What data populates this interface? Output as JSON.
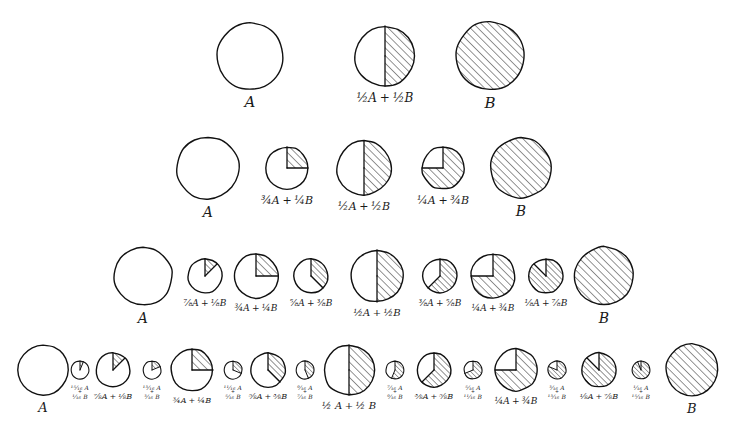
{
  "diagram": {
    "style": {
      "ink": "#111111",
      "paper": "#ffffff",
      "hatch": "#111111",
      "hatch_direction": "lower-left to upper-right",
      "wedge_start": "12 o'clock, clockwise"
    },
    "endpoint_labels": {
      "a": "A",
      "b": "B"
    },
    "rows": [
      {
        "name": "row-halves",
        "denominator": 2,
        "y": 18,
        "items": [
          {
            "label": "A",
            "lines": [
              "A"
            ],
            "b_fraction": 0,
            "r": 33,
            "cx": 250,
            "label_size": 15
          },
          {
            "label": "1/2 A + 1/2 B",
            "lines": [
              "½A + ½B"
            ],
            "b_fraction": 0.5,
            "r": 30,
            "cx": 385,
            "label_size": 12
          },
          {
            "label": "B",
            "lines": [
              "B"
            ],
            "b_fraction": 1,
            "r": 34,
            "cx": 490,
            "label_size": 15
          }
        ]
      },
      {
        "name": "row-quarters",
        "denominator": 4,
        "y": 133,
        "items": [
          {
            "label": "A",
            "lines": [
              "A"
            ],
            "b_fraction": 0,
            "r": 31,
            "cx": 208,
            "label_size": 14
          },
          {
            "label": "3/4 A + 1/4 B",
            "lines": [
              "¾A + ¼B"
            ],
            "b_fraction": 0.25,
            "r": 21,
            "cx": 287,
            "label_size": 11
          },
          {
            "label": "1/2 A + 1/2 B",
            "lines": [
              "½A + ½B"
            ],
            "b_fraction": 0.5,
            "r": 27,
            "cx": 364,
            "label_size": 11
          },
          {
            "label": "1/4 A + 3/4 B",
            "lines": [
              "¼A + ¾B"
            ],
            "b_fraction": 0.75,
            "r": 21,
            "cx": 443,
            "label_size": 11
          },
          {
            "label": "B",
            "lines": [
              "B"
            ],
            "b_fraction": 1,
            "r": 30,
            "cx": 521,
            "label_size": 14
          }
        ]
      },
      {
        "name": "row-eighths",
        "denominator": 8,
        "y": 243,
        "items": [
          {
            "label": "A",
            "lines": [
              "A"
            ],
            "b_fraction": 0,
            "r": 29,
            "cx": 143,
            "label_size": 14
          },
          {
            "label": "7/8 A + 1/8 B",
            "lines": [
              "⅞A + ⅛B"
            ],
            "b_fraction": 0.125,
            "r": 17,
            "cx": 205,
            "label_size": 9
          },
          {
            "label": "3/4 A + 1/4 B",
            "lines": [
              "¾A + ¼B"
            ],
            "b_fraction": 0.25,
            "r": 22,
            "cx": 256,
            "label_size": 9
          },
          {
            "label": "5/8 A + 3/8 B",
            "lines": [
              "⅝A + ⅜B"
            ],
            "b_fraction": 0.375,
            "r": 17,
            "cx": 311,
            "label_size": 9
          },
          {
            "label": "1/2 A + 1/2 B",
            "lines": [
              "½A + ½B"
            ],
            "b_fraction": 0.5,
            "r": 26,
            "cx": 377,
            "label_size": 10
          },
          {
            "label": "3/8 A + 5/8 B",
            "lines": [
              "⅜A + ⅝B"
            ],
            "b_fraction": 0.625,
            "r": 17,
            "cx": 440,
            "label_size": 9
          },
          {
            "label": "1/4 A + 3/4 B",
            "lines": [
              "¼A + ¾B"
            ],
            "b_fraction": 0.75,
            "r": 22,
            "cx": 493,
            "label_size": 9
          },
          {
            "label": "1/8 A + 7/8 B",
            "lines": [
              "⅛A + ⅞B"
            ],
            "b_fraction": 0.875,
            "r": 17,
            "cx": 546,
            "label_size": 9
          },
          {
            "label": "B",
            "lines": [
              "B"
            ],
            "b_fraction": 1,
            "r": 29,
            "cx": 604,
            "label_size": 14
          }
        ]
      },
      {
        "name": "row-sixteenths",
        "denominator": 16,
        "y": 340,
        "items": [
          {
            "label": "A",
            "lines": [
              "A"
            ],
            "b_fraction": 0,
            "r": 25,
            "cx": 43,
            "label_size": 13
          },
          {
            "label": "15/16 A + 1/16 B",
            "lines": [
              "¹⁵⁄₁₆ A",
              "¹⁄₁₆ B"
            ],
            "two_line": true,
            "b_fraction": 0.0625,
            "r": 9,
            "cx": 80,
            "label_size": 6
          },
          {
            "label": "7/8 A + 1/8 B",
            "lines": [
              "⅞A + ⅛B"
            ],
            "b_fraction": 0.125,
            "r": 17,
            "cx": 113,
            "label_size": 8
          },
          {
            "label": "13/16 A + 3/16 B",
            "lines": [
              "¹³⁄₁₆ A",
              "³⁄₁₆ B"
            ],
            "two_line": true,
            "b_fraction": 0.1875,
            "r": 9,
            "cx": 152,
            "label_size": 6
          },
          {
            "label": "3/4 A + 1/4 B",
            "lines": [
              "¾A + ¼B"
            ],
            "b_fraction": 0.25,
            "r": 21,
            "cx": 192,
            "label_size": 8
          },
          {
            "label": "11/16 A + 5/16 B",
            "lines": [
              "¹¹⁄₁₆ A",
              "⁵⁄₁₆ B"
            ],
            "two_line": true,
            "b_fraction": 0.3125,
            "r": 9,
            "cx": 233,
            "label_size": 6
          },
          {
            "label": "5/8 A + 3/8 B",
            "lines": [
              "⅝A + ⅜B"
            ],
            "b_fraction": 0.375,
            "r": 17,
            "cx": 268,
            "label_size": 8
          },
          {
            "label": "9/16 A + 7/16 B",
            "lines": [
              "⁹⁄₁₆ A",
              "⁷⁄₁₆ B"
            ],
            "two_line": true,
            "b_fraction": 0.4375,
            "r": 9,
            "cx": 305,
            "label_size": 6
          },
          {
            "label": "1/2 A + 1/2 B",
            "lines": [
              "½ A + ½ B"
            ],
            "b_fraction": 0.5,
            "r": 25,
            "cx": 349,
            "label_size": 10
          },
          {
            "label": "7/16 A + 9/16 B",
            "lines": [
              "⁷⁄₁₆ A",
              "⁹⁄₁₆ B"
            ],
            "two_line": true,
            "b_fraction": 0.5625,
            "r": 9,
            "cx": 395,
            "label_size": 6
          },
          {
            "label": "3/8 A + 5/8 B",
            "lines": [
              "⅜A + ⅝B"
            ],
            "b_fraction": 0.625,
            "r": 17,
            "cx": 434,
            "label_size": 8
          },
          {
            "label": "5/16 A + 11/16 B",
            "lines": [
              "⁵⁄₁₆ A",
              "¹¹⁄₁₆ B"
            ],
            "two_line": true,
            "b_fraction": 0.6875,
            "r": 9,
            "cx": 473,
            "label_size": 6
          },
          {
            "label": "1/4 A + 3/4 B",
            "lines": [
              "¼A + ¾B"
            ],
            "b_fraction": 0.75,
            "r": 21,
            "cx": 516,
            "label_size": 9
          },
          {
            "label": "3/16 A + 13/16 B",
            "lines": [
              "³⁄₁₆ A",
              "¹³⁄₁₆ B"
            ],
            "two_line": true,
            "b_fraction": 0.8125,
            "r": 9,
            "cx": 557,
            "label_size": 6
          },
          {
            "label": "1/8 A + 7/8 B",
            "lines": [
              "⅛A + ⅞B"
            ],
            "b_fraction": 0.875,
            "r": 17,
            "cx": 599,
            "label_size": 8
          },
          {
            "label": "1/16 A + 15/16 B",
            "lines": [
              "¹⁄₁₆ A",
              "¹⁵⁄₁₆ B"
            ],
            "two_line": true,
            "b_fraction": 0.9375,
            "r": 9,
            "cx": 641,
            "label_size": 6
          },
          {
            "label": "B",
            "lines": [
              "B"
            ],
            "b_fraction": 1,
            "r": 26,
            "cx": 692,
            "label_size": 13
          }
        ]
      }
    ]
  }
}
